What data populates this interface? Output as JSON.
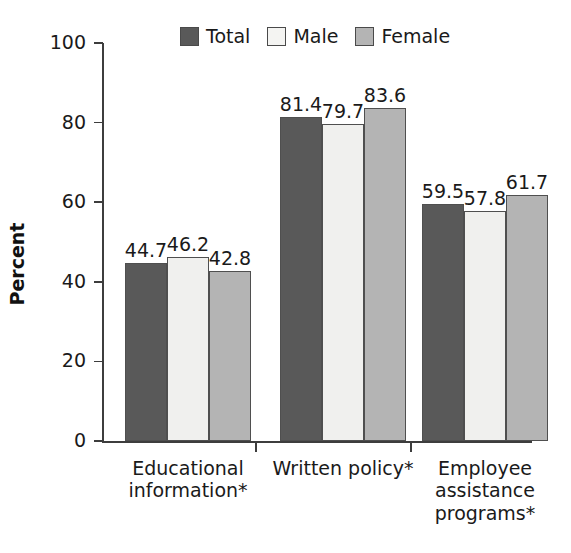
{
  "chart_data": {
    "type": "bar",
    "title": "",
    "xlabel": "",
    "ylabel": "Percent",
    "ylim": [
      0,
      100
    ],
    "yticks": [
      0,
      20,
      40,
      60,
      80,
      100
    ],
    "grid": false,
    "legend_position": "top-center",
    "categories": [
      "Educational\ninformation*",
      "Written policy*",
      "Employee\nassistance\nprograms*"
    ],
    "series": [
      {
        "name": "Total",
        "color": "#595959",
        "values": [
          44.7,
          81.4,
          59.5
        ]
      },
      {
        "name": "Male",
        "color": "#f0f0ee",
        "values": [
          46.2,
          79.7,
          57.8
        ]
      },
      {
        "name": "Female",
        "color": "#b4b4b4",
        "values": [
          42.8,
          83.6,
          61.7
        ]
      }
    ],
    "value_labels": [
      "44.7",
      "46.2",
      "42.8",
      "81.4",
      "79.7",
      "83.6",
      "59.5",
      "57.8",
      "61.7"
    ]
  },
  "axis": {
    "y_tick_labels": [
      "100",
      "80",
      "60",
      "40",
      "20",
      "0"
    ],
    "y_title": "Percent"
  },
  "legend": {
    "items": [
      {
        "label": "Total"
      },
      {
        "label": "Male"
      },
      {
        "label": "Female"
      }
    ]
  },
  "header": {
    "title_fragment": ""
  }
}
